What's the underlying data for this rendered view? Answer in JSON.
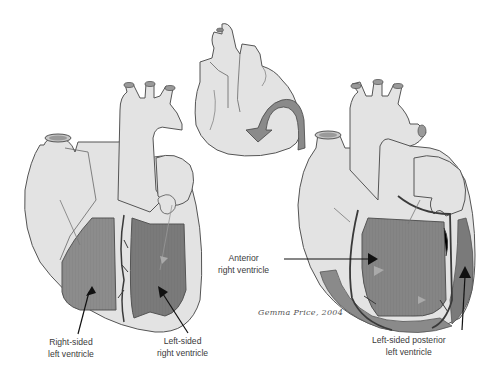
{
  "figure": {
    "colors": {
      "heart_fill": "#e3e3e3",
      "outline": "#555555",
      "ventricle_right": "#8c8c8c",
      "ventricle_left": "#7a7a7a",
      "rotation_arrow": "#8a8a8a",
      "label_text": "#3a3a3a",
      "background": "#ffffff"
    },
    "panels": [
      {
        "id": "left-heart",
        "labels": [
          {
            "line1": "Right-sided",
            "line2": "left ventricle"
          },
          {
            "line1": "Left-sided",
            "line2": "right ventricle"
          }
        ]
      },
      {
        "id": "center-heart",
        "icon": "rotation-arrow-icon",
        "labels": []
      },
      {
        "id": "right-heart",
        "labels": [
          {
            "line1": "Anterior",
            "line2": "right ventricle"
          },
          {
            "line1": "Left-sided posterior",
            "line2": "left ventricle"
          }
        ]
      }
    ],
    "signature": "Gemma Price, 2004"
  }
}
